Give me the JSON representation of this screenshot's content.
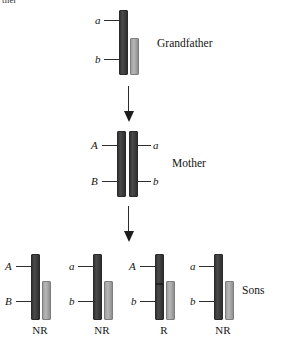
{
  "figure": {
    "clipped_text": "ther",
    "generations": [
      {
        "id": "grandfather",
        "label": "Grandfather",
        "chromosomes": [
          {
            "shade": "dark",
            "recombinant": false
          },
          {
            "shade": "light",
            "recombinant": false
          }
        ],
        "alleles": [
          {
            "symbol": "a",
            "side": "left"
          },
          {
            "symbol": "b",
            "side": "left"
          }
        ]
      },
      {
        "id": "mother",
        "label": "Mother",
        "chromosomes": [
          {
            "shade": "dark",
            "recombinant": false
          },
          {
            "shade": "dark",
            "recombinant": false
          }
        ],
        "alleles": [
          {
            "symbol": "A",
            "side": "left"
          },
          {
            "symbol": "B",
            "side": "left"
          },
          {
            "symbol": "a",
            "side": "right"
          },
          {
            "symbol": "b",
            "side": "right"
          }
        ]
      },
      {
        "id": "sons",
        "label": "Sons",
        "offspring": [
          {
            "id": "son-1",
            "alleles": [
              "A",
              "B"
            ],
            "status": "NR",
            "recombinant": false
          },
          {
            "id": "son-2",
            "alleles": [
              "a",
              "b"
            ],
            "status": "NR",
            "recombinant": false
          },
          {
            "id": "son-3",
            "alleles": [
              "A",
              "b"
            ],
            "status": "R",
            "recombinant": true
          },
          {
            "id": "son-4",
            "alleles": [
              "a",
              "b"
            ],
            "status": "NR",
            "recombinant": false
          }
        ]
      }
    ],
    "arrows": [
      {
        "id": "arrow-grandfather-to-mother"
      },
      {
        "id": "arrow-mother-to-sons"
      }
    ],
    "colors": {
      "chromosome_dark": "#3a3a3a",
      "chromosome_light": "#a8a8a8",
      "text": "#141414",
      "background": "#ffffff"
    }
  }
}
